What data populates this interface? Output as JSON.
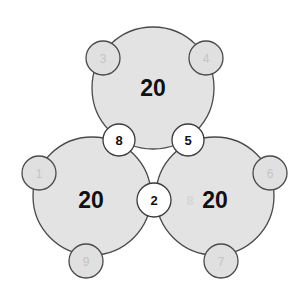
{
  "diagram": {
    "big_circles": [
      {
        "id": "top",
        "label": "20",
        "cx": 153,
        "cy": 88,
        "r": 61
      },
      {
        "id": "left",
        "label": "20",
        "cx": 92,
        "cy": 196,
        "r": 59
      },
      {
        "id": "right",
        "label": "20",
        "cx": 215,
        "cy": 196,
        "r": 59
      }
    ],
    "outer_circles": [
      {
        "label": "3",
        "cx": 103,
        "cy": 58,
        "r": 17
      },
      {
        "label": "4",
        "cx": 206,
        "cy": 58,
        "r": 17
      },
      {
        "label": "1",
        "cx": 39,
        "cy": 173,
        "r": 17
      },
      {
        "label": "6",
        "cx": 270,
        "cy": 173,
        "r": 17
      },
      {
        "label": "9",
        "cx": 86,
        "cy": 261,
        "r": 17
      },
      {
        "label": "7",
        "cx": 221,
        "cy": 261,
        "r": 17
      }
    ],
    "shared_circles": [
      {
        "label": "8",
        "cx": 119,
        "cy": 140,
        "r": 16
      },
      {
        "label": "5",
        "cx": 188,
        "cy": 140,
        "r": 16
      },
      {
        "label": "2",
        "cx": 154,
        "cy": 200,
        "r": 17
      }
    ],
    "ghost_text": {
      "label": "8",
      "x": 190,
      "y": 205
    },
    "colors": {
      "big_fill": "#e3e3e3",
      "outer_fill": "#e0e0e0",
      "shared_fill": "#ffffff",
      "stroke": "#4a4a4a",
      "big_text": "#111111",
      "outer_text": "#c4c4c4"
    }
  }
}
